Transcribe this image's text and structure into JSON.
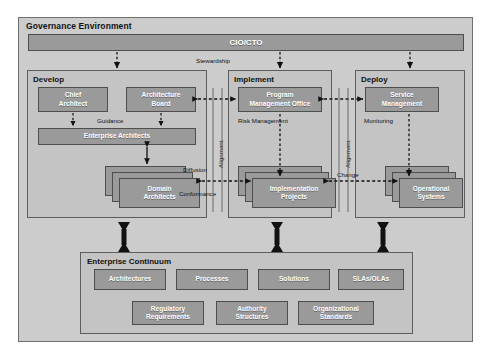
{
  "diagram": {
    "title": "Governance Environment",
    "top_bar": {
      "label": "CIO/CTO"
    },
    "sections": [
      {
        "id": "develop",
        "title": "Develop",
        "boxes": [
          {
            "id": "chief-architect",
            "label": "Chief\nArchitect"
          },
          {
            "id": "architecture-board",
            "label": "Architecture\nBoard"
          },
          {
            "id": "enterprise-architects",
            "label": "Enterprise Architects"
          },
          {
            "id": "domain-architects",
            "label": "Domain\nArchitects",
            "stacked": true
          }
        ]
      },
      {
        "id": "implement",
        "title": "Implement",
        "boxes": [
          {
            "id": "program-management-office",
            "label": "Program\nManagement Office"
          },
          {
            "id": "implementation-projects",
            "label": "Implementation\nProjects",
            "stacked": true
          }
        ]
      },
      {
        "id": "deploy",
        "title": "Deploy",
        "boxes": [
          {
            "id": "service-management",
            "label": "Service\nManagement"
          },
          {
            "id": "operational-systems",
            "label": "Operational\nSystems",
            "stacked": true
          }
        ]
      }
    ],
    "continuum": {
      "title": "Enterprise Continuum",
      "row1": [
        {
          "id": "architectures",
          "label": "Architectures"
        },
        {
          "id": "processes",
          "label": "Processes"
        },
        {
          "id": "solutions",
          "label": "Solutions"
        },
        {
          "id": "slas-olas",
          "label": "SLAs/OLAs"
        }
      ],
      "row2": [
        {
          "id": "regulatory-requirements",
          "label": "Regulatory\nRequirements"
        },
        {
          "id": "authority-structures",
          "label": "Authority\nStructures"
        },
        {
          "id": "organizational-standards",
          "label": "Organizational\nStandards"
        }
      ]
    },
    "connector_labels": [
      {
        "id": "stewardship",
        "text": "Stewardship"
      },
      {
        "id": "guidance",
        "text": "Guidance"
      },
      {
        "id": "diffusion",
        "text": "Diffusion"
      },
      {
        "id": "conformance",
        "text": "Conformance"
      },
      {
        "id": "alignment-left",
        "text": "Alignment"
      },
      {
        "id": "alignment-right",
        "text": "Alignment"
      },
      {
        "id": "risk-management",
        "text": "Risk Management"
      },
      {
        "id": "monitoring",
        "text": "Monitoring"
      },
      {
        "id": "change",
        "text": "Change"
      }
    ],
    "colors": {
      "frame_fill": "#cccccc",
      "section_fill": "#c4c4c4",
      "box_fill": "#9a9a9a",
      "box_border": "#4e4e4e",
      "line": "#111111",
      "text_on_box": "#ffffff"
    }
  }
}
